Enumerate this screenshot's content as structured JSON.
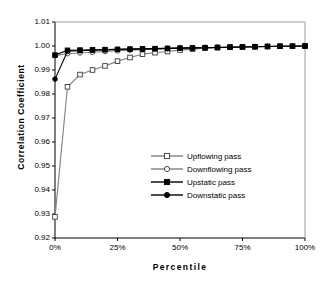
{
  "chart_data": {
    "type": "line",
    "title": "",
    "xlabel": "Percentile",
    "ylabel": "Correlation Coefficient",
    "xlim": [
      0,
      100
    ],
    "ylim": [
      0.92,
      1.01
    ],
    "grid": false,
    "legend_position": "inside-lower-right",
    "x_tick_labels": [
      "0%",
      "25%",
      "50%",
      "75%",
      "100%"
    ],
    "x_tick_values": [
      0,
      25,
      50,
      75,
      100
    ],
    "y_tick_labels": [
      "0.92",
      "0.93",
      "0.94",
      "0.95",
      "0.96",
      "0.97",
      "0.98",
      "0.99",
      "1.00",
      "1.01"
    ],
    "y_tick_values": [
      0.92,
      0.93,
      0.94,
      0.95,
      0.96,
      0.97,
      0.98,
      0.99,
      1.0,
      1.01
    ],
    "x": [
      0,
      5,
      10,
      15,
      20,
      25,
      30,
      35,
      40,
      45,
      50,
      55,
      60,
      65,
      70,
      75,
      80,
      85,
      90,
      95,
      100
    ],
    "series": [
      {
        "name": "Upflowing pass",
        "marker": "open-square",
        "color": "#808080",
        "marker_fill": "#ffffff",
        "marker_edge": "#3a3a3a",
        "values": [
          0.9288,
          0.983,
          0.9881,
          0.99,
          0.9917,
          0.9937,
          0.9952,
          0.9966,
          0.9972,
          0.9977,
          0.9983,
          0.9987,
          0.9991,
          0.9993,
          0.9995,
          0.9996,
          0.9997,
          0.9998,
          0.9999,
          0.9999,
          1.0
        ]
      },
      {
        "name": "Downflowing pass",
        "marker": "open-circle",
        "color": "#808080",
        "marker_fill": "#ffffff",
        "marker_edge": "#3a3a3a",
        "values": [
          0.996,
          0.9968,
          0.9971,
          0.9974,
          0.9977,
          0.998,
          0.9983,
          0.9985,
          0.9987,
          0.9989,
          0.9991,
          0.9992,
          0.9994,
          0.9995,
          0.9996,
          0.9997,
          0.9998,
          0.9998,
          0.9999,
          0.9999,
          1.0
        ]
      },
      {
        "name": "Upstatic pass",
        "marker": "filled-square",
        "color": "#000000",
        "marker_fill": "#000000",
        "marker_edge": "#000000",
        "values": [
          0.9962,
          0.9982,
          0.9983,
          0.9984,
          0.9985,
          0.9986,
          0.9987,
          0.9988,
          0.9989,
          0.999,
          0.9991,
          0.9992,
          0.9993,
          0.9994,
          0.9995,
          0.9996,
          0.9997,
          0.9998,
          0.9999,
          0.9999,
          1.0
        ]
      },
      {
        "name": "Downstatic pass",
        "marker": "filled-circle",
        "color": "#000000",
        "marker_fill": "#000000",
        "marker_edge": "#000000",
        "values": [
          0.9862,
          0.9978,
          0.998,
          0.9982,
          0.9984,
          0.9986,
          0.9987,
          0.9988,
          0.9989,
          0.999,
          0.9991,
          0.9992,
          0.9993,
          0.9994,
          0.9995,
          0.9996,
          0.9997,
          0.9998,
          0.9999,
          0.9999,
          1.0
        ]
      }
    ]
  }
}
